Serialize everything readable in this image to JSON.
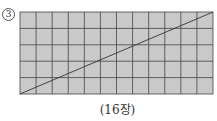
{
  "problem": {
    "number_label": "3",
    "caption": "(16장)"
  },
  "grid": {
    "columns": 12,
    "rows": 5,
    "fill_color": "#c9c9c9",
    "line_color": "#444444",
    "diagonal": "bottom-left to top-right"
  }
}
